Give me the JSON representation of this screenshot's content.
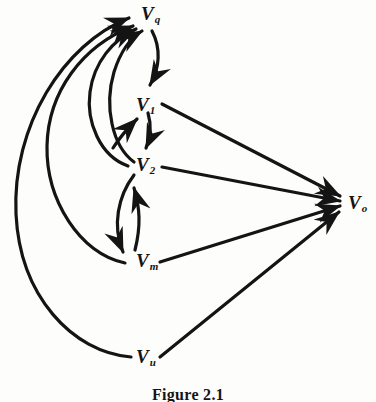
{
  "figure": {
    "caption": "Figure 2.1",
    "background_color": "#fdfdfc",
    "ink_color": "#141414"
  },
  "nodes": [
    {
      "id": "vq",
      "main": "V",
      "sub": "q",
      "label": "Vq",
      "x": 141,
      "y": 4
    },
    {
      "id": "v1",
      "main": "V",
      "sub": "1",
      "label": "V1",
      "x": 136,
      "y": 95
    },
    {
      "id": "v2",
      "main": "V",
      "sub": "2",
      "label": "V2",
      "x": 136,
      "y": 155
    },
    {
      "id": "vm",
      "main": "V",
      "sub": "m",
      "label": "Vm",
      "x": 136,
      "y": 251
    },
    {
      "id": "vu",
      "main": "V",
      "sub": "u",
      "label": "Vu",
      "x": 136,
      "y": 347
    },
    {
      "id": "vo",
      "main": "V",
      "sub": "o",
      "label": "Vo",
      "x": 348,
      "y": 193
    }
  ],
  "edges": [
    {
      "id": "e-v1-vq",
      "from": "v1",
      "to": "vq",
      "style": "arc"
    },
    {
      "id": "e-v2-vq",
      "from": "v2",
      "to": "vq",
      "style": "arc"
    },
    {
      "id": "e-vm-vq",
      "from": "vm",
      "to": "vq",
      "style": "arc"
    },
    {
      "id": "e-vu-vq",
      "from": "vu",
      "to": "vq",
      "style": "arc"
    },
    {
      "id": "e-vq-v1",
      "from": "vq",
      "to": "v1",
      "style": "arc"
    },
    {
      "id": "e-v2-v1",
      "from": "v2",
      "to": "v1",
      "style": "arc"
    },
    {
      "id": "e-v1-v2",
      "from": "v1",
      "to": "v2",
      "style": "arc"
    },
    {
      "id": "e-vm-v2",
      "from": "vm",
      "to": "v2",
      "style": "arc"
    },
    {
      "id": "e-v2-vm",
      "from": "v2",
      "to": "vm",
      "style": "arc"
    },
    {
      "id": "e-v1-vo",
      "from": "v1",
      "to": "vo",
      "style": "straight"
    },
    {
      "id": "e-v2-vo",
      "from": "v2",
      "to": "vo",
      "style": "straight"
    },
    {
      "id": "e-vm-vo",
      "from": "vm",
      "to": "vo",
      "style": "straight"
    },
    {
      "id": "e-vu-vo",
      "from": "vu",
      "to": "vo",
      "style": "straight"
    }
  ]
}
